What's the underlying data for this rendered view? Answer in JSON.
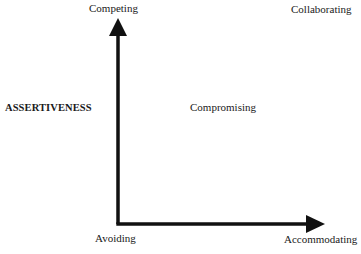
{
  "diagram": {
    "type": "conflict-modes-quadrant",
    "y_axis_title": "ASSERTIVENESS",
    "modes": {
      "top_left": "Competing",
      "top_right": "Collaborating",
      "center": "Compromising",
      "bottom_left": "Avoiding",
      "bottom_right": "Accommodating"
    },
    "colors": {
      "ink": "#111111",
      "background": "#ffffff"
    }
  }
}
